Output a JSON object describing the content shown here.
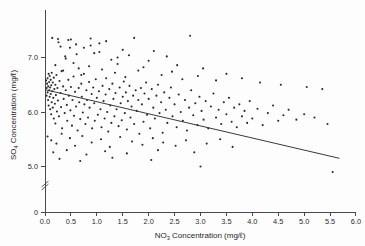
{
  "chart_data": {
    "type": "scatter",
    "title": "",
    "xlabel": "NO3 Concentration (mg/ℓ)",
    "ylabel": "SO4 Concentration (mg/ℓ)",
    "xlabel_parts": {
      "base": "NO",
      "sub": "3",
      "rest": " Concentration (mg/ℓ)"
    },
    "ylabel_parts": {
      "base": "SO",
      "sub": "4",
      "rest": " Concentration (mg/ℓ)"
    },
    "xlim": [
      0.0,
      6.0
    ],
    "ylim": [
      4.55,
      7.55
    ],
    "y_axis_break": true,
    "y_break_value": 4.75,
    "grid": false,
    "legend": null,
    "xticks": [
      "0.0",
      "0.5",
      "1.0",
      "1.5",
      "2.0",
      "2.5",
      "3.0",
      "3.5",
      "4.0",
      "4.5",
      "5.0",
      "5.5",
      "6.0"
    ],
    "xtick_values": [
      0.0,
      0.5,
      1.0,
      1.5,
      2.0,
      2.5,
      3.0,
      3.5,
      4.0,
      4.5,
      5.0,
      5.5,
      6.0
    ],
    "yticks": [
      "0",
      "5.0",
      "6.0",
      "7.0"
    ],
    "ytick_values": [
      4.62,
      5.0,
      6.0,
      7.0
    ],
    "marker_color": "#2a2a2a",
    "line_color": "#3a3a3a",
    "axis_color": "#4a4a4a",
    "background": "#fdfdfd",
    "trendline": {
      "type": "linear-regression",
      "x0": 0.0,
      "y0": 6.41,
      "x1": 5.68,
      "y1": 5.15
    },
    "points": [
      [
        0.02,
        6.58
      ],
      [
        0.03,
        6.44
      ],
      [
        0.03,
        6.3
      ],
      [
        0.04,
        6.52
      ],
      [
        0.05,
        6.36
      ],
      [
        0.05,
        6.62
      ],
      [
        0.06,
        6.22
      ],
      [
        0.06,
        6.47
      ],
      [
        0.07,
        6.7
      ],
      [
        0.07,
        6.12
      ],
      [
        0.08,
        6.4
      ],
      [
        0.08,
        6.55
      ],
      [
        0.09,
        6.28
      ],
      [
        0.09,
        6.66
      ],
      [
        0.1,
        6.05
      ],
      [
        0.1,
        6.45
      ],
      [
        0.11,
        6.33
      ],
      [
        0.11,
        6.59
      ],
      [
        0.12,
        5.96
      ],
      [
        0.12,
        6.49
      ],
      [
        0.13,
        6.18
      ],
      [
        0.13,
        6.72
      ],
      [
        0.14,
        6.38
      ],
      [
        0.15,
        6.08
      ],
      [
        0.15,
        6.54
      ],
      [
        0.16,
        6.26
      ],
      [
        0.17,
        6.63
      ],
      [
        0.17,
        5.88
      ],
      [
        0.18,
        6.42
      ],
      [
        0.19,
        6.15
      ],
      [
        0.2,
        6.5
      ],
      [
        0.2,
        5.79
      ],
      [
        0.21,
        6.31
      ],
      [
        0.22,
        6.68
      ],
      [
        0.23,
        6.01
      ],
      [
        0.24,
        6.44
      ],
      [
        0.25,
        6.21
      ],
      [
        0.26,
        7.28
      ],
      [
        0.27,
        5.92
      ],
      [
        0.28,
        6.57
      ],
      [
        0.3,
        6.35
      ],
      [
        0.31,
        6.09
      ],
      [
        0.32,
        6.75
      ],
      [
        0.33,
        5.7
      ],
      [
        0.35,
        6.47
      ],
      [
        0.36,
        6.24
      ],
      [
        0.38,
        5.98
      ],
      [
        0.39,
        7.02
      ],
      [
        0.4,
        6.4
      ],
      [
        0.42,
        6.13
      ],
      [
        0.43,
        5.84
      ],
      [
        0.45,
        6.59
      ],
      [
        0.46,
        6.3
      ],
      [
        0.48,
        7.18
      ],
      [
        0.49,
        6.03
      ],
      [
        0.5,
        6.46
      ],
      [
        0.52,
        5.75
      ],
      [
        0.53,
        6.22
      ],
      [
        0.55,
        6.65
      ],
      [
        0.56,
        5.93
      ],
      [
        0.58,
        6.37
      ],
      [
        0.6,
        6.1
      ],
      [
        0.61,
        7.06
      ],
      [
        0.63,
        5.66
      ],
      [
        0.65,
        6.44
      ],
      [
        0.66,
        6.18
      ],
      [
        0.68,
        5.87
      ],
      [
        0.7,
        6.52
      ],
      [
        0.71,
        6.28
      ],
      [
        0.73,
        5.99
      ],
      [
        0.75,
        6.7
      ],
      [
        0.76,
        6.14
      ],
      [
        0.78,
        5.78
      ],
      [
        0.8,
        6.4
      ],
      [
        0.81,
        6.22
      ],
      [
        0.83,
        5.9
      ],
      [
        0.85,
        6.55
      ],
      [
        0.86,
        6.08
      ],
      [
        0.88,
        7.22
      ],
      [
        0.9,
        6.33
      ],
      [
        0.91,
        5.7
      ],
      [
        0.93,
        6.45
      ],
      [
        0.95,
        6.16
      ],
      [
        0.96,
        5.84
      ],
      [
        0.98,
        6.6
      ],
      [
        1.0,
        6.26
      ],
      [
        1.02,
        5.95
      ],
      [
        1.04,
        6.38
      ],
      [
        1.05,
        7.1
      ],
      [
        1.07,
        6.05
      ],
      [
        1.09,
        5.72
      ],
      [
        1.11,
        6.48
      ],
      [
        1.13,
        6.2
      ],
      [
        1.15,
        5.88
      ],
      [
        1.17,
        6.32
      ],
      [
        1.18,
        6.62
      ],
      [
        1.2,
        6.0
      ],
      [
        1.22,
        5.64
      ],
      [
        1.24,
        6.42
      ],
      [
        1.26,
        6.12
      ],
      [
        1.28,
        5.8
      ],
      [
        1.3,
        6.52
      ],
      [
        1.32,
        6.24
      ],
      [
        1.34,
        5.92
      ],
      [
        1.36,
        6.35
      ],
      [
        1.38,
        6.05
      ],
      [
        1.4,
        7.0
      ],
      [
        1.42,
        5.74
      ],
      [
        1.44,
        6.45
      ],
      [
        1.46,
        6.16
      ],
      [
        1.48,
        5.85
      ],
      [
        1.5,
        6.28
      ],
      [
        1.52,
        6.56
      ],
      [
        1.54,
        5.98
      ],
      [
        1.56,
        6.36
      ],
      [
        1.58,
        5.68
      ],
      [
        1.6,
        6.2
      ],
      [
        1.63,
        6.48
      ],
      [
        1.65,
        5.9
      ],
      [
        1.67,
        6.1
      ],
      [
        1.7,
        6.3
      ],
      [
        1.72,
        5.78
      ],
      [
        1.75,
        6.4
      ],
      [
        1.77,
        6.02
      ],
      [
        1.8,
        6.22
      ],
      [
        1.82,
        5.6
      ],
      [
        1.85,
        6.44
      ],
      [
        1.87,
        6.14
      ],
      [
        1.9,
        5.82
      ],
      [
        1.92,
        6.34
      ],
      [
        1.95,
        6.54
      ],
      [
        1.97,
        5.95
      ],
      [
        2.0,
        6.24
      ],
      [
        2.03,
        5.7
      ],
      [
        2.06,
        6.42
      ],
      [
        2.09,
        6.08
      ],
      [
        2.12,
        5.88
      ],
      [
        2.15,
        6.3
      ],
      [
        2.18,
        6.5
      ],
      [
        2.21,
        5.98
      ],
      [
        2.24,
        6.18
      ],
      [
        2.27,
        5.62
      ],
      [
        2.3,
        6.36
      ],
      [
        2.33,
        6.04
      ],
      [
        2.36,
        5.8
      ],
      [
        2.4,
        6.26
      ],
      [
        2.43,
        6.45
      ],
      [
        2.46,
        5.92
      ],
      [
        2.5,
        6.14
      ],
      [
        2.54,
        5.72
      ],
      [
        2.58,
        6.32
      ],
      [
        2.62,
        6.0
      ],
      [
        2.66,
        5.84
      ],
      [
        2.7,
        6.22
      ],
      [
        2.74,
        5.66
      ],
      [
        2.78,
        6.08
      ],
      [
        2.82,
        6.4
      ],
      [
        2.86,
        5.94
      ],
      [
        2.9,
        6.16
      ],
      [
        2.94,
        5.76
      ],
      [
        2.98,
        6.28
      ],
      [
        3.02,
        6.02
      ],
      [
        3.06,
        5.86
      ],
      [
        3.1,
        6.2
      ],
      [
        3.15,
        5.7
      ],
      [
        3.2,
        6.1
      ],
      [
        3.25,
        6.34
      ],
      [
        3.3,
        5.9
      ],
      [
        3.35,
        6.04
      ],
      [
        3.4,
        5.78
      ],
      [
        3.45,
        6.18
      ],
      [
        3.5,
        5.96
      ],
      [
        3.55,
        6.26
      ],
      [
        3.6,
        5.82
      ],
      [
        3.65,
        6.08
      ],
      [
        3.7,
        5.72
      ],
      [
        3.75,
        6.14
      ],
      [
        3.8,
        5.92
      ],
      [
        3.85,
        6.02
      ],
      [
        3.9,
        5.8
      ],
      [
        3.95,
        6.2
      ],
      [
        4.0,
        5.88
      ],
      [
        4.1,
        6.06
      ],
      [
        4.2,
        5.76
      ],
      [
        4.3,
        5.98
      ],
      [
        4.4,
        6.12
      ],
      [
        4.5,
        5.84
      ],
      [
        4.6,
        5.94
      ],
      [
        4.7,
        6.04
      ],
      [
        4.85,
        5.86
      ],
      [
        5.0,
        5.96
      ],
      [
        5.2,
        5.9
      ],
      [
        5.45,
        5.78
      ],
      [
        5.55,
        4.9
      ],
      [
        0.14,
        7.36
      ],
      [
        0.25,
        7.34
      ],
      [
        0.45,
        7.32
      ],
      [
        0.5,
        7.33
      ],
      [
        0.88,
        7.35
      ],
      [
        1.18,
        7.3
      ],
      [
        1.72,
        7.36
      ],
      [
        2.8,
        7.4
      ],
      [
        0.6,
        7.24
      ],
      [
        1.05,
        7.26
      ],
      [
        0.3,
        7.2
      ],
      [
        0.75,
        7.18
      ],
      [
        1.5,
        7.14
      ],
      [
        2.1,
        7.12
      ],
      [
        0.95,
        7.08
      ],
      [
        1.62,
        7.04
      ],
      [
        2.35,
        7.02
      ],
      [
        0.4,
        6.98
      ],
      [
        1.28,
        6.96
      ],
      [
        2.0,
        6.94
      ],
      [
        0.55,
        6.9
      ],
      [
        1.4,
        6.88
      ],
      [
        2.55,
        6.86
      ],
      [
        0.85,
        6.84
      ],
      [
        1.9,
        6.82
      ],
      [
        3.05,
        6.8
      ],
      [
        0.2,
        6.86
      ],
      [
        0.65,
        6.8
      ],
      [
        1.1,
        6.78
      ],
      [
        1.8,
        6.76
      ],
      [
        2.45,
        6.74
      ],
      [
        3.5,
        6.7
      ],
      [
        0.35,
        6.76
      ],
      [
        1.35,
        6.72
      ],
      [
        2.25,
        6.68
      ],
      [
        2.95,
        6.66
      ],
      [
        3.8,
        6.62
      ],
      [
        0.7,
        6.68
      ],
      [
        1.55,
        6.64
      ],
      [
        2.65,
        6.6
      ],
      [
        3.3,
        6.58
      ],
      [
        4.15,
        6.54
      ],
      [
        4.55,
        6.5
      ],
      [
        5.05,
        6.46
      ],
      [
        5.35,
        6.42
      ],
      [
        0.05,
        5.55
      ],
      [
        0.12,
        5.48
      ],
      [
        0.22,
        5.42
      ],
      [
        0.32,
        5.6
      ],
      [
        0.48,
        5.52
      ],
      [
        0.58,
        5.38
      ],
      [
        0.72,
        5.56
      ],
      [
        0.9,
        5.44
      ],
      [
        1.08,
        5.5
      ],
      [
        1.25,
        5.36
      ],
      [
        1.45,
        5.54
      ],
      [
        1.68,
        5.46
      ],
      [
        1.88,
        5.4
      ],
      [
        2.08,
        5.52
      ],
      [
        2.28,
        5.44
      ],
      [
        2.52,
        5.38
      ],
      [
        2.72,
        5.48
      ],
      [
        3.12,
        5.42
      ],
      [
        3.38,
        5.5
      ],
      [
        3.62,
        5.36
      ],
      [
        0.16,
        5.26
      ],
      [
        0.42,
        5.3
      ],
      [
        0.8,
        5.22
      ],
      [
        1.16,
        5.28
      ],
      [
        1.58,
        5.24
      ],
      [
        2.18,
        5.3
      ],
      [
        2.88,
        5.26
      ],
      [
        0.28,
        5.14
      ],
      [
        0.68,
        5.1
      ],
      [
        1.3,
        5.16
      ],
      [
        2.05,
        5.12
      ],
      [
        3.0,
        5.0
      ]
    ]
  },
  "axis_geometry": {
    "plot_left_px": 45,
    "plot_right_px": 356,
    "axis_top_px": 10,
    "axis_bottom_px": 212,
    "y_value_top_px": 16,
    "y_7_px": 57,
    "y_6_px": 112,
    "y_5_px": 166,
    "px_per_x_unit": 51.83,
    "px_per_y_unit": 54.5
  }
}
